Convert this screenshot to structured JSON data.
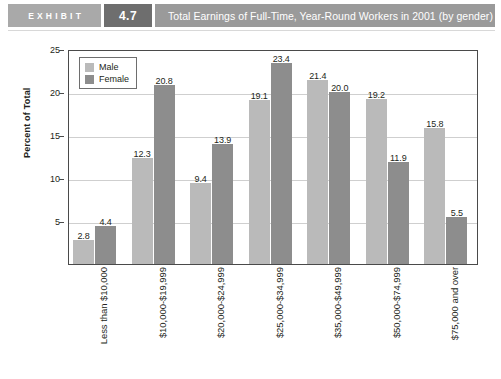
{
  "header": {
    "exhibit_label": "EXHIBIT",
    "exhibit_number": "4.7",
    "title": "Total Earnings of Full-Time, Year-Round Workers in 2001 (by gender)",
    "colors": {
      "exhibit_bg": "#a9a9a9",
      "number_bg": "#6e6e6e",
      "title_bg": "#9a9a9a"
    }
  },
  "chart_data": {
    "type": "bar",
    "title": "Total Earnings of Full-Time, Year-Round Workers in 2001 (by gender)",
    "xlabel": "",
    "ylabel": "Percent of Total",
    "ylim": [
      0,
      25
    ],
    "yticks": [
      5,
      10,
      15,
      20,
      25
    ],
    "grid": true,
    "legend_position": "top-left",
    "categories": [
      "Less than $10,000",
      "$10,000-$19,999",
      "$20,000-$24,999",
      "$25,000-$34,999",
      "$35,000-$49,999",
      "$50,000-$74,999",
      "$75,000 and over"
    ],
    "series": [
      {
        "name": "Male",
        "color": "#bababa",
        "values": [
          2.8,
          12.3,
          9.4,
          19.1,
          21.4,
          19.2,
          15.8
        ],
        "labels": [
          "2.8",
          "12.3",
          "9.4",
          "19.1",
          "21.4",
          "19.2",
          "15.8"
        ]
      },
      {
        "name": "Female",
        "color": "#8d8d8d",
        "values": [
          4.4,
          20.8,
          13.9,
          23.4,
          20.0,
          11.9,
          5.5
        ],
        "labels": [
          "4.4",
          "20.8",
          "13.9",
          "23.4",
          "20.0",
          "11.9",
          "5.5"
        ]
      }
    ]
  }
}
